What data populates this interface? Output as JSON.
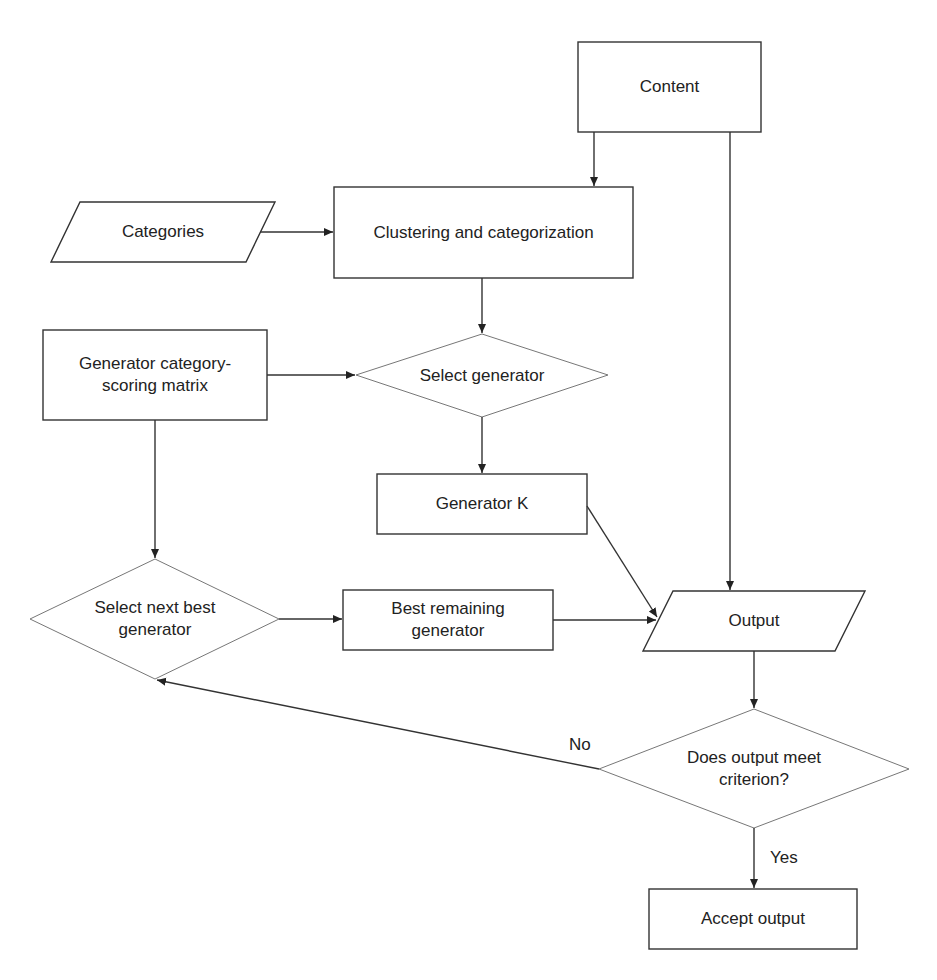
{
  "diagram": {
    "type": "flowchart",
    "nodes": {
      "content": {
        "label": "Content",
        "shape": "rectangle"
      },
      "categories": {
        "label": "Categories",
        "shape": "parallelogram"
      },
      "clustering": {
        "label": "Clustering and categorization",
        "shape": "rectangle"
      },
      "matrix": {
        "label_line1": "Generator category-",
        "label_line2": "scoring matrix",
        "shape": "rectangle"
      },
      "select_generator": {
        "label": "Select generator",
        "shape": "diamond"
      },
      "generator_k": {
        "label": "Generator K",
        "shape": "rectangle"
      },
      "select_next_best": {
        "label_line1": "Select next best",
        "label_line2": "generator",
        "shape": "diamond"
      },
      "best_remaining": {
        "label_line1": "Best remaining",
        "label_line2": "generator",
        "shape": "rectangle"
      },
      "output": {
        "label": "Output",
        "shape": "parallelogram"
      },
      "criterion": {
        "label_line1": "Does output meet",
        "label_line2": "criterion?",
        "shape": "diamond"
      },
      "accept": {
        "label": "Accept output",
        "shape": "rectangle"
      }
    },
    "edges": [
      {
        "from": "content",
        "to": "clustering"
      },
      {
        "from": "content",
        "to": "output"
      },
      {
        "from": "categories",
        "to": "clustering"
      },
      {
        "from": "clustering",
        "to": "select_generator"
      },
      {
        "from": "matrix",
        "to": "select_generator"
      },
      {
        "from": "matrix",
        "to": "select_next_best"
      },
      {
        "from": "select_generator",
        "to": "generator_k"
      },
      {
        "from": "generator_k",
        "to": "output"
      },
      {
        "from": "select_next_best",
        "to": "best_remaining"
      },
      {
        "from": "best_remaining",
        "to": "output"
      },
      {
        "from": "output",
        "to": "criterion"
      },
      {
        "from": "criterion",
        "to": "select_next_best",
        "label": "No"
      },
      {
        "from": "criterion",
        "to": "accept",
        "label": "Yes"
      }
    ],
    "edge_labels": {
      "no": "No",
      "yes": "Yes"
    },
    "colors": {
      "stroke": "#333333",
      "diamond_stroke": "#666666",
      "background": "#ffffff"
    }
  }
}
